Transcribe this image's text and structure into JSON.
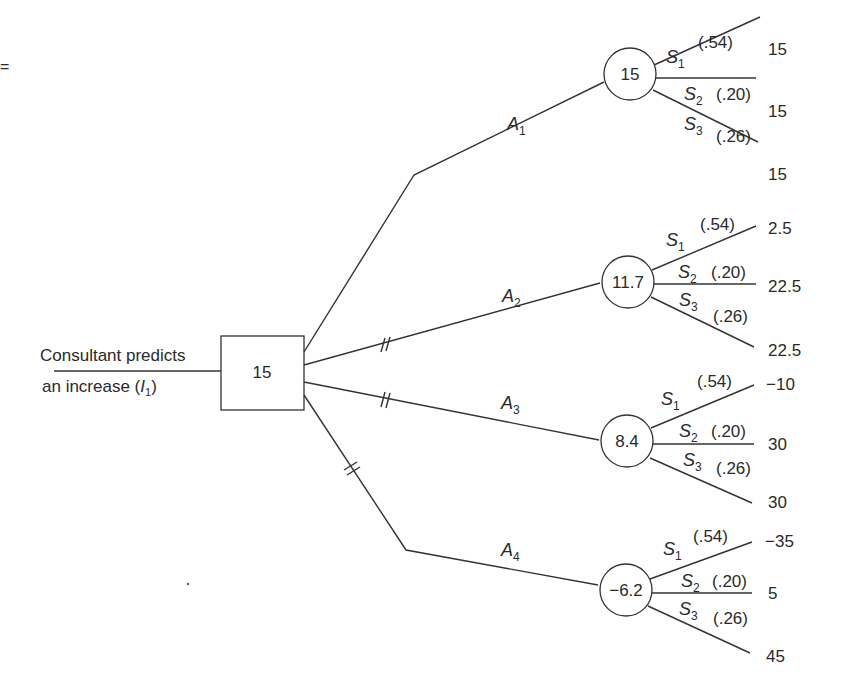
{
  "diagram": {
    "type": "decision-tree",
    "margin_mark": "=",
    "root": {
      "label_line1": "Consultant predicts",
      "label_line2_pre": "an increase (",
      "label_line2_var": "I",
      "label_line2_sub": "1",
      "label_line2_post": ")"
    },
    "decision_node": {
      "value": "15"
    },
    "actions": [
      {
        "label": "A",
        "sub": "1",
        "chance_value": "15",
        "pruned": false,
        "states": [
          {
            "label": "S",
            "sub": "1",
            "prob": "(.54)",
            "payoff": "15"
          },
          {
            "label": "S",
            "sub": "2",
            "prob": "(.20)",
            "payoff": "15"
          },
          {
            "label": "S",
            "sub": "3",
            "prob": "(.26)",
            "payoff": "15"
          }
        ]
      },
      {
        "label": "A",
        "sub": "2",
        "chance_value": "11.7",
        "pruned": true,
        "states": [
          {
            "label": "S",
            "sub": "1",
            "prob": "(.54)",
            "payoff": "2.5"
          },
          {
            "label": "S",
            "sub": "2",
            "prob": "(.20)",
            "payoff": "22.5"
          },
          {
            "label": "S",
            "sub": "3",
            "prob": "(.26)",
            "payoff": "22.5"
          }
        ]
      },
      {
        "label": "A",
        "sub": "3",
        "chance_value": "8.4",
        "pruned": true,
        "states": [
          {
            "label": "S",
            "sub": "1",
            "prob": "(.54)",
            "payoff": "−10"
          },
          {
            "label": "S",
            "sub": "2",
            "prob": "(.20)",
            "payoff": "30"
          },
          {
            "label": "S",
            "sub": "3",
            "prob": "(.26)",
            "payoff": "30"
          }
        ]
      },
      {
        "label": "A",
        "sub": "4",
        "chance_value": "−6.2",
        "pruned": true,
        "states": [
          {
            "label": "S",
            "sub": "1",
            "prob": "(.54)",
            "payoff": "−35"
          },
          {
            "label": "S",
            "sub": "2",
            "prob": "(.20)",
            "payoff": "5"
          },
          {
            "label": "S",
            "sub": "3",
            "prob": "(.26)",
            "payoff": "45"
          }
        ]
      }
    ]
  }
}
